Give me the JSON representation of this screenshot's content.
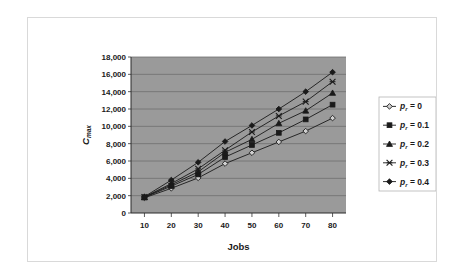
{
  "chart_data": {
    "type": "line",
    "title": "",
    "xlabel": "Jobs",
    "ylabel": "Cmax",
    "ylabel_main": "C",
    "ylabel_sub": "max",
    "x": [
      10,
      20,
      30,
      40,
      50,
      60,
      70,
      80
    ],
    "xlim": [
      5,
      85
    ],
    "ylim": [
      0,
      18000
    ],
    "ytick_labels": [
      "0",
      "2,000",
      "4,000",
      "6,000",
      "8,000",
      "10,000",
      "12,000",
      "14,000",
      "16,000",
      "18,000"
    ],
    "ytick_values": [
      0,
      2000,
      4000,
      6000,
      8000,
      10000,
      12000,
      14000,
      16000,
      18000
    ],
    "xtick_labels": [
      "10",
      "20",
      "30",
      "40",
      "50",
      "60",
      "70",
      "80"
    ],
    "grid": "horizontal",
    "legend_position": "right",
    "plot_bgcolor": "#9a9a9a",
    "gridline_color": "#6e6e6e",
    "line_color": "#1a1a1a",
    "series": [
      {
        "name": "p_r = 0",
        "label_main": "p",
        "label_sub": "r",
        "label_rest": " = 0",
        "marker": "open-diamond",
        "values": [
          1750,
          2850,
          4050,
          5700,
          6950,
          8200,
          9450,
          10950
        ]
      },
      {
        "name": "p_r = 0.1",
        "label_main": "p",
        "label_sub": "r",
        "label_rest": " = 0.1",
        "marker": "filled-square",
        "values": [
          1800,
          3100,
          4450,
          6450,
          7850,
          9250,
          10800,
          12500
        ]
      },
      {
        "name": "p_r = 0.2",
        "label_main": "p",
        "label_sub": "r",
        "label_rest": " = 0.2",
        "marker": "filled-triangle",
        "values": [
          1820,
          3250,
          4750,
          7000,
          8500,
          10350,
          11800,
          13850
        ]
      },
      {
        "name": "p_r = 0.3",
        "label_main": "p",
        "label_sub": "r",
        "label_rest": " = 0.3",
        "marker": "cross-x",
        "values": [
          1850,
          3400,
          5100,
          7250,
          9350,
          11200,
          12850,
          15150
        ]
      },
      {
        "name": "p_r = 0.4",
        "label_main": "p",
        "label_sub": "r",
        "label_rest": " = 0.4",
        "marker": "filled-diamond",
        "values": [
          1880,
          3800,
          5850,
          8250,
          10100,
          12000,
          14000,
          16250
        ]
      }
    ]
  }
}
